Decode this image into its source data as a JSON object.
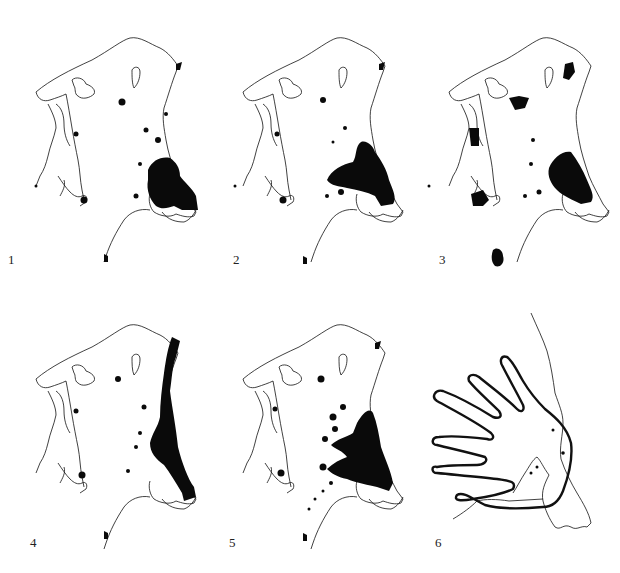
{
  "figure": {
    "panels": [
      {
        "id": 1,
        "label": "1",
        "content": "base map with compact central urban mass"
      },
      {
        "id": 2,
        "label": "2",
        "content": "base map with larger central urban mass spreading west"
      },
      {
        "id": 3,
        "label": "3",
        "content": "base map with scattered satellite urban blocks"
      },
      {
        "id": 4,
        "label": "4",
        "content": "base map with linear coastal urban corridor"
      },
      {
        "id": 5,
        "label": "5",
        "content": "base map with radial finger-like urban extensions"
      },
      {
        "id": 6,
        "label": "6",
        "content": "hand-shaped outline overlaid on coastline"
      }
    ]
  },
  "colors": {
    "background": "#ffffff",
    "ink": "#0a0a0a"
  }
}
